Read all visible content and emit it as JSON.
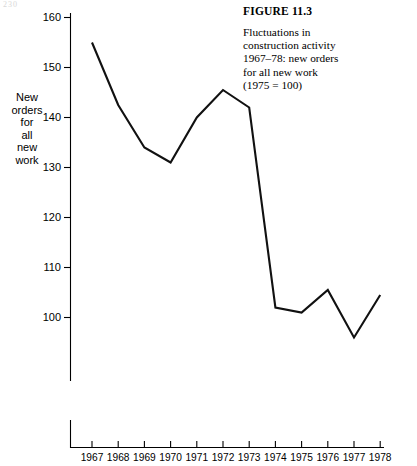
{
  "page_number": "230",
  "caption": {
    "figure_label": "FIGURE 11.3",
    "description": "Fluctuations in\nconstruction activity\n1967–78: new orders\nfor all new work\n(1975 = 100)"
  },
  "axis_title": {
    "y": "New\norders\nfor\nall\nnew\nwork"
  },
  "chart_data": {
    "type": "line",
    "title": "Fluctuations in construction activity 1967–78: new orders for all new work (1975 = 100)",
    "xlabel": "",
    "ylabel": "New orders for all new work",
    "categories": [
      "1967",
      "1968",
      "1969",
      "1970",
      "1971",
      "1972",
      "1973",
      "1974",
      "1975",
      "1976",
      "1977",
      "1978"
    ],
    "values": [
      155,
      142.5,
      134,
      131,
      140,
      145.5,
      142,
      102,
      101,
      105.5,
      96,
      104.5
    ],
    "ytick_labels": [
      "100",
      "110",
      "120",
      "130",
      "140",
      "150",
      "160"
    ],
    "ytick_values": [
      100,
      110,
      120,
      130,
      140,
      150,
      160
    ],
    "ylim": [
      96,
      162
    ],
    "axis_break": true,
    "grid": false,
    "legend": "none",
    "line_color": "#111111"
  }
}
